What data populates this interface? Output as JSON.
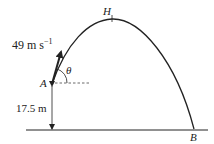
{
  "diagram": {
    "type": "projectile-motion",
    "labels": {
      "velocity": "49 m s",
      "velocity_exp": "−1",
      "point_start": "A",
      "point_top": "H",
      "point_end": "B",
      "angle": "θ",
      "height": "17.5 m"
    },
    "colors": {
      "line": "#222222",
      "background": "#ffffff"
    }
  }
}
